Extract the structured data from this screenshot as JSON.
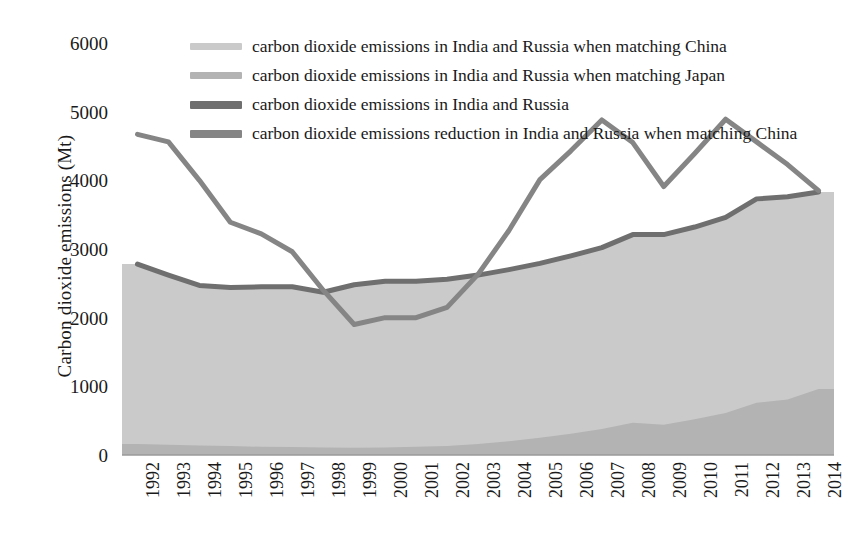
{
  "axes": {
    "y_title": "Carbon dioxide emissions (Mt)",
    "y_ticks": [
      "0",
      "1000",
      "2000",
      "3000",
      "4000",
      "5000",
      "6000"
    ],
    "x_ticks": [
      "1992",
      "1993",
      "1994",
      "1995",
      "1996",
      "1997",
      "1998",
      "1999",
      "2000",
      "2001",
      "2002",
      "2003",
      "2004",
      "2005",
      "2006",
      "2007",
      "2008",
      "2009",
      "2010",
      "2011",
      "2012",
      "2013",
      "2014"
    ]
  },
  "legend": {
    "items": [
      {
        "label": "carbon dioxide emissions in India and Russia when matching China",
        "swatch": "area-light-swatch",
        "color": "#cacaca",
        "kind": "area"
      },
      {
        "label": "carbon dioxide emissions in India and Russia when matching Japan",
        "swatch": "area-mid-swatch",
        "color": "#b3b3b3",
        "kind": "area"
      },
      {
        "label": "carbon dioxide emissions in India and Russia",
        "swatch": "line-dark-swatch",
        "color": "#6f6f6f",
        "kind": "line"
      },
      {
        "label": "carbon dioxide emissions reduction in India and Russia when matching China",
        "swatch": "line-reduction-swatch",
        "color": "#858585",
        "kind": "line"
      }
    ]
  },
  "colors": {
    "area_china": "#cacaca",
    "area_japan": "#b3b3b3",
    "line_total": "#6f6f6f",
    "line_reduction": "#858585",
    "axis": "#9a9a9a",
    "text": "#1a1a1a"
  },
  "chart_data": {
    "type": "line",
    "title": "",
    "xlabel": "",
    "ylabel": "Carbon dioxide emissions (Mt)",
    "ylim": [
      0,
      6000
    ],
    "ytick_step": 1000,
    "grid": false,
    "legend_position": "top-center",
    "x": [
      1992,
      1993,
      1994,
      1995,
      1996,
      1997,
      1998,
      1999,
      2000,
      2001,
      2002,
      2003,
      2004,
      2005,
      2006,
      2007,
      2008,
      2009,
      2010,
      2011,
      2012,
      2013,
      2014
    ],
    "series": [
      {
        "name": "carbon dioxide emissions in India and Russia when matching China",
        "type": "area",
        "color": "#cacaca",
        "values": [
          2780,
          2620,
          2470,
          2440,
          2450,
          2450,
          2370,
          2480,
          2530,
          2530,
          2560,
          2620,
          2700,
          2790,
          2900,
          3020,
          3210,
          3210,
          3320,
          3460,
          3730,
          3760,
          3830
        ]
      },
      {
        "name": "carbon dioxide emissions in India and Russia when matching Japan",
        "type": "area",
        "color": "#b3b3b3",
        "values": [
          160,
          150,
          140,
          130,
          120,
          115,
          110,
          105,
          110,
          120,
          130,
          160,
          200,
          250,
          310,
          380,
          470,
          440,
          520,
          610,
          760,
          810,
          960
        ]
      },
      {
        "name": "carbon dioxide emissions in India and Russia",
        "type": "line",
        "color": "#6f6f6f",
        "values": [
          2780,
          2620,
          2470,
          2440,
          2450,
          2450,
          2370,
          2480,
          2530,
          2530,
          2560,
          2620,
          2700,
          2790,
          2900,
          3020,
          3210,
          3210,
          3320,
          3460,
          3730,
          3760,
          3830
        ]
      },
      {
        "name": "carbon dioxide emissions reduction in India and Russia when matching China",
        "type": "line",
        "color": "#858585",
        "values": [
          4670,
          4560,
          4000,
          3390,
          3220,
          2960,
          2400,
          1900,
          2000,
          2000,
          2150,
          2630,
          3270,
          4010,
          4430,
          4880,
          4550,
          3910,
          4390,
          4890,
          4560,
          4230,
          3850
        ]
      }
    ]
  }
}
